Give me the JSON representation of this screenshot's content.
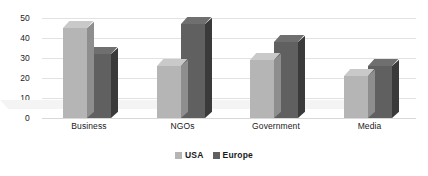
{
  "chart_data": {
    "type": "bar",
    "title": "",
    "subtitle": "",
    "xlabel": "",
    "ylabel": "",
    "categories": [
      "Business",
      "NGOs",
      "Government",
      "Media"
    ],
    "series": [
      {
        "name": "USA",
        "values": [
          45,
          26,
          29,
          21
        ],
        "color": "#b5b5b5"
      },
      {
        "name": "Europe",
        "values": [
          32,
          47,
          38,
          26
        ],
        "color": "#606060"
      }
    ],
    "ylim": [
      0,
      50
    ],
    "yticks": [
      0,
      10,
      20,
      30,
      40,
      50
    ],
    "ytick_labels": [
      "0",
      "10",
      "20",
      "30",
      "40",
      "50"
    ],
    "grid": true,
    "grid_axis": "y",
    "grid_color": "#e2e2e2",
    "legend_position": "bottom-center",
    "legend": [
      "USA",
      "Europe"
    ],
    "style": "3d-clustered-column",
    "background": "#ffffff"
  }
}
